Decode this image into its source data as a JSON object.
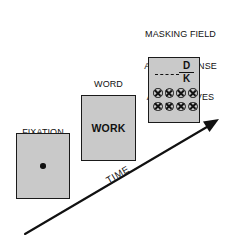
{
  "figure": {
    "background_color": "#ffffff",
    "ink_color": "#111111",
    "panel_fill_color": "#c9c9c9"
  },
  "panels": [
    {
      "id": "fixation",
      "caption_lines": [
        "FIXATION",
        "POINT"
      ],
      "content_type": "dot",
      "content_text": ""
    },
    {
      "id": "word",
      "caption_lines": [
        "WORD",
        "OR",
        "LETTER"
      ],
      "content_type": "text",
      "content_text": "WORK"
    },
    {
      "id": "mask",
      "caption_lines": [
        "MASKING FIELD",
        "AND RESPONSE",
        "ALTERNATIVES"
      ],
      "content_type": "mask-field",
      "content_text": ""
    }
  ],
  "mask_panel": {
    "response_alternatives": [
      "D",
      "K"
    ],
    "mask_rows": [
      [
        "mask-x",
        "mask-x",
        "mask-x",
        "mask-x"
      ],
      [
        "mask-x",
        "mask-x",
        "mask-x",
        "mask-x"
      ]
    ],
    "mask_symbol": "circled-x",
    "dashed_line": true
  },
  "axis": {
    "label": "TIME",
    "direction": "up-right",
    "arrowhead": true
  }
}
